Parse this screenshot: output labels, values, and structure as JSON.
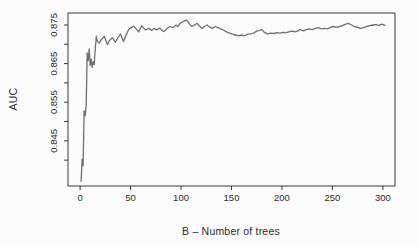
{
  "figure": {
    "background": "#fcfcfc",
    "axis_color": "#3a3a3a",
    "text_color": "#2b2b2b",
    "line_color": "#707070"
  },
  "chart_data": {
    "type": "line",
    "title": "",
    "xlabel": "B – Number of trees",
    "ylabel": "AUC",
    "grid": false,
    "legend": null,
    "xlim": [
      -12,
      312
    ],
    "ylim": [
      0.8333,
      0.8781
    ],
    "x_ticks": [
      {
        "value": 0,
        "label": "0"
      },
      {
        "value": 50,
        "label": "50"
      },
      {
        "value": 100,
        "label": "100"
      },
      {
        "value": 150,
        "label": "150"
      },
      {
        "value": 200,
        "label": "200"
      },
      {
        "value": 250,
        "label": "250"
      },
      {
        "value": 300,
        "label": "300"
      }
    ],
    "y_ticks": [
      0.84,
      0.845,
      0.85,
      0.855,
      0.86,
      0.865,
      0.87,
      0.875
    ],
    "y_tick_labels": [
      {
        "value": 0.845,
        "label": "0.845"
      },
      {
        "value": 0.855,
        "label": "0.855"
      },
      {
        "value": 0.865,
        "label": "0.865"
      },
      {
        "value": 0.875,
        "label": "0.875"
      }
    ],
    "series": [
      {
        "name": "AUC",
        "color": "#707070",
        "points": [
          [
            1,
            0.8345
          ],
          [
            2,
            0.8402
          ],
          [
            3,
            0.8385
          ],
          [
            4,
            0.8528
          ],
          [
            5,
            0.8515
          ],
          [
            6,
            0.8543
          ],
          [
            7,
            0.8678
          ],
          [
            8,
            0.8658
          ],
          [
            9,
            0.8688
          ],
          [
            10,
            0.8645
          ],
          [
            11,
            0.8662
          ],
          [
            12,
            0.864
          ],
          [
            13,
            0.8655
          ],
          [
            14,
            0.8647
          ],
          [
            15,
            0.869
          ],
          [
            16,
            0.8721
          ],
          [
            17,
            0.8708
          ],
          [
            19,
            0.8703
          ],
          [
            21,
            0.8712
          ],
          [
            24,
            0.8721
          ],
          [
            27,
            0.8699
          ],
          [
            29,
            0.871
          ],
          [
            32,
            0.8717
          ],
          [
            35,
            0.8705
          ],
          [
            37,
            0.8715
          ],
          [
            40,
            0.8727
          ],
          [
            43,
            0.8707
          ],
          [
            45,
            0.872
          ],
          [
            48,
            0.8738
          ],
          [
            50,
            0.8742
          ],
          [
            53,
            0.8747
          ],
          [
            55,
            0.8742
          ],
          [
            58,
            0.8732
          ],
          [
            61,
            0.8748
          ],
          [
            63,
            0.8742
          ],
          [
            65,
            0.8737
          ],
          [
            68,
            0.8741
          ],
          [
            71,
            0.8736
          ],
          [
            73,
            0.8741
          ],
          [
            76,
            0.8737
          ],
          [
            79,
            0.8742
          ],
          [
            81,
            0.8736
          ],
          [
            83,
            0.8733
          ],
          [
            86,
            0.874
          ],
          [
            89,
            0.8746
          ],
          [
            92,
            0.8743
          ],
          [
            95,
            0.875
          ],
          [
            97,
            0.8746
          ],
          [
            99,
            0.8754
          ],
          [
            101,
            0.8757
          ],
          [
            103,
            0.876
          ],
          [
            105,
            0.8763
          ],
          [
            107,
            0.8758
          ],
          [
            109,
            0.875
          ],
          [
            111,
            0.8746
          ],
          [
            113,
            0.875
          ],
          [
            116,
            0.8754
          ],
          [
            118,
            0.8748
          ],
          [
            121,
            0.8741
          ],
          [
            123,
            0.8746
          ],
          [
            126,
            0.875
          ],
          [
            128,
            0.8745
          ],
          [
            131,
            0.8741
          ],
          [
            134,
            0.8746
          ],
          [
            136,
            0.8744
          ],
          [
            139,
            0.874
          ],
          [
            142,
            0.8737
          ],
          [
            145,
            0.8732
          ],
          [
            148,
            0.8729
          ],
          [
            151,
            0.8726
          ],
          [
            154,
            0.8724
          ],
          [
            157,
            0.8722
          ],
          [
            160,
            0.8724
          ],
          [
            163,
            0.8722
          ],
          [
            166,
            0.8726
          ],
          [
            169,
            0.8727
          ],
          [
            172,
            0.8729
          ],
          [
            175,
            0.8734
          ],
          [
            178,
            0.8736
          ],
          [
            180,
            0.8738
          ],
          [
            183,
            0.873
          ],
          [
            186,
            0.8727
          ],
          [
            189,
            0.8729
          ],
          [
            192,
            0.8728
          ],
          [
            195,
            0.873
          ],
          [
            198,
            0.8729
          ],
          [
            201,
            0.8731
          ],
          [
            204,
            0.873
          ],
          [
            207,
            0.8732
          ],
          [
            210,
            0.8734
          ],
          [
            213,
            0.8732
          ],
          [
            216,
            0.8735
          ],
          [
            218,
            0.8738
          ],
          [
            221,
            0.8735
          ],
          [
            224,
            0.8738
          ],
          [
            227,
            0.874
          ],
          [
            230,
            0.8738
          ],
          [
            233,
            0.8741
          ],
          [
            236,
            0.8743
          ],
          [
            239,
            0.874
          ],
          [
            242,
            0.8741
          ],
          [
            245,
            0.874
          ],
          [
            248,
            0.8744
          ],
          [
            251,
            0.8746
          ],
          [
            254,
            0.8744
          ],
          [
            257,
            0.8746
          ],
          [
            260,
            0.8748
          ],
          [
            263,
            0.8752
          ],
          [
            266,
            0.8754
          ],
          [
            269,
            0.875
          ],
          [
            272,
            0.8746
          ],
          [
            275,
            0.8744
          ],
          [
            278,
            0.8741
          ],
          [
            281,
            0.8743
          ],
          [
            284,
            0.8746
          ],
          [
            287,
            0.8748
          ],
          [
            290,
            0.875
          ],
          [
            293,
            0.8751
          ],
          [
            296,
            0.8749
          ],
          [
            299,
            0.8752
          ],
          [
            302,
            0.8749
          ]
        ]
      }
    ]
  }
}
